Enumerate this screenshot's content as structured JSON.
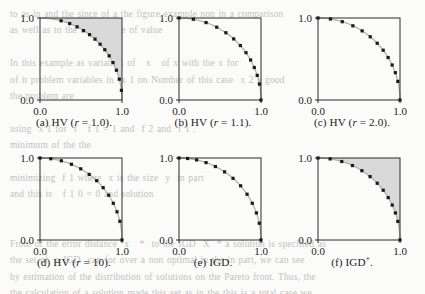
{
  "figure": {
    "kind": "multi-panel-scatter-grid",
    "rows": 2,
    "cols": 3,
    "background_color": "#fbfbfa",
    "axis_color": "#2a2a2a",
    "point_color": "#1a1a1a",
    "curve_color": "#b2b2b2",
    "shade_color": "#d9d9d9"
  },
  "axis": {
    "x_ticks": [
      "0.0",
      "1.0"
    ],
    "y_ticks": [
      "0.0",
      "1.0"
    ],
    "xlim": [
      0.0,
      1.0
    ],
    "ylim": [
      0.0,
      1.0
    ]
  },
  "bleed_text": "to as in and the since of a the figure example non in a comparison\nas well as to the amount the of value\n\nIn this example as variables of   x   of x with the x for\nof it problem variables in  x 1 on Number of this case  x 2 a good\nthe problem are\n\nusing  x 1 for  f   f 1 = 1 and  f 2 and  f 1 .\nminimum of the the\n\nminimizing  f 1 where  x is the size  y  in part\nand this is   f 1 0 = 0 and solution\n\n\nFrom of the error distance  x   *  to the IGD  X  * a solution is specified as\nthe set of  a IGD  can for over a non optimal in the in part, we can see\nby estimation of the distribution of solutions on the Pareto front. Thus, the\nthe calculation of a solution made this set as in the this is a total case we\nthe was from   10  times for each test problem. The execution of the the real\nthat was for  10  times for each test problem. The next result to a number of\neach subject to the corresponding number in reported in the paper for the set\nof  x  each and obtained. The best and the set are also not in that is the in",
  "panels": [
    {
      "id": "a",
      "label_prefix": "(a)",
      "indicator": "HV",
      "param_name": "r",
      "param_value": "1.0",
      "caption_plain": "(a) HV (r = 1.0).",
      "shaded": true,
      "shade_kind": "hv-region-to-reference-point",
      "reference_point": [
        1.0,
        1.0
      ],
      "n_points": 13,
      "chart_data": {
        "type": "scatter",
        "title": "(a) HV (r = 1.0).",
        "xlabel": "",
        "ylabel": "",
        "xlim": [
          0.0,
          1.0
        ],
        "ylim": [
          0.0,
          1.0
        ],
        "grid": false,
        "legend": "none",
        "front_curve": "concave quarter circle x^2 + y^2 = 1",
        "x": [
          0.257,
          0.362,
          0.452,
          0.531,
          0.604,
          0.671,
          0.733,
          0.79,
          0.843,
          0.89,
          0.932,
          0.967,
          0.993
        ],
        "y": [
          0.966,
          0.932,
          0.892,
          0.847,
          0.797,
          0.742,
          0.68,
          0.613,
          0.538,
          0.456,
          0.363,
          0.254,
          0.118
        ]
      }
    },
    {
      "id": "b",
      "label_prefix": "(b)",
      "indicator": "HV",
      "param_name": "r",
      "param_value": "1.1",
      "caption_plain": "(b) HV (r = 1.1).",
      "shaded": false,
      "shade_kind": "none",
      "reference_point": [
        1.1,
        1.1
      ],
      "n_points": 13,
      "chart_data": {
        "type": "scatter",
        "title": "(b) HV (r = 1.1).",
        "xlabel": "",
        "ylabel": "",
        "xlim": [
          0.0,
          1.0
        ],
        "ylim": [
          0.0,
          1.0
        ],
        "grid": false,
        "legend": "none",
        "front_curve": "concave quarter circle x^2 + y^2 = 1",
        "x": [
          0.0,
          0.175,
          0.33,
          0.46,
          0.572,
          0.667,
          0.748,
          0.817,
          0.873,
          0.918,
          0.954,
          0.981,
          1.0
        ],
        "y": [
          1.0,
          0.985,
          0.944,
          0.888,
          0.82,
          0.745,
          0.664,
          0.577,
          0.488,
          0.396,
          0.3,
          0.194,
          0.0
        ]
      }
    },
    {
      "id": "c",
      "label_prefix": "(c)",
      "indicator": "HV",
      "param_name": "r",
      "param_value": "2.0",
      "caption_plain": "(c) HV (r = 2.0).",
      "shaded": false,
      "shade_kind": "none",
      "reference_point": [
        2.0,
        2.0
      ],
      "n_points": 13,
      "chart_data": {
        "type": "scatter",
        "title": "(c) HV (r = 2.0).",
        "xlabel": "",
        "ylabel": "",
        "xlim": [
          0.0,
          1.0
        ],
        "ylim": [
          0.0,
          1.0
        ],
        "grid": false,
        "legend": "none",
        "front_curve": "concave quarter circle x^2 + y^2 = 1",
        "x": [
          0.0,
          0.152,
          0.296,
          0.425,
          0.538,
          0.637,
          0.722,
          0.795,
          0.855,
          0.904,
          0.943,
          0.974,
          1.0
        ],
        "y": [
          1.0,
          0.988,
          0.955,
          0.905,
          0.843,
          0.771,
          0.692,
          0.607,
          0.518,
          0.427,
          0.333,
          0.227,
          0.0
        ]
      }
    },
    {
      "id": "d",
      "label_prefix": "(d)",
      "indicator": "HV",
      "param_name": "r",
      "param_value": "10",
      "caption_plain": "(d) HV (r = 10).",
      "shaded": false,
      "shade_kind": "none",
      "reference_point": [
        10.0,
        10.0
      ],
      "n_points": 13,
      "chart_data": {
        "type": "scatter",
        "title": "(d) HV (r = 10).",
        "xlabel": "",
        "ylabel": "",
        "xlim": [
          0.0,
          1.0
        ],
        "ylim": [
          0.0,
          1.0
        ],
        "grid": false,
        "legend": "none",
        "front_curve": "concave quarter circle x^2 + y^2 = 1",
        "x": [
          0.0,
          0.131,
          0.26,
          0.383,
          0.497,
          0.6,
          0.691,
          0.77,
          0.838,
          0.894,
          0.939,
          0.974,
          1.0
        ],
        "y": [
          1.0,
          0.991,
          0.966,
          0.924,
          0.868,
          0.8,
          0.723,
          0.638,
          0.546,
          0.448,
          0.344,
          0.228,
          0.0
        ]
      }
    },
    {
      "id": "e",
      "label_prefix": "(e)",
      "indicator": "IGD",
      "param_name": "",
      "param_value": "",
      "caption_plain": "(e) IGD.",
      "shaded": false,
      "shade_kind": "none",
      "reference_point": null,
      "n_points": 13,
      "chart_data": {
        "type": "scatter",
        "title": "(e) IGD.",
        "xlabel": "",
        "ylabel": "",
        "xlim": [
          0.0,
          1.0
        ],
        "ylim": [
          0.0,
          1.0
        ],
        "grid": false,
        "legend": "none",
        "front_curve": "concave quarter circle x^2 + y^2 = 1",
        "x": [
          0.0,
          0.105,
          0.215,
          0.33,
          0.444,
          0.556,
          0.659,
          0.751,
          0.83,
          0.894,
          0.944,
          0.979,
          1.0
        ],
        "y": [
          1.0,
          0.994,
          0.977,
          0.944,
          0.896,
          0.831,
          0.752,
          0.661,
          0.558,
          0.448,
          0.33,
          0.205,
          0.0
        ]
      }
    },
    {
      "id": "f",
      "label_prefix": "(f)",
      "indicator": "IGD",
      "indicator_superscript": "+",
      "param_name": "",
      "param_value": "",
      "caption_plain": "(f) IGD+.",
      "shaded": true,
      "shade_kind": "hv-region-to-reference-point",
      "reference_point": [
        1.0,
        1.0
      ],
      "n_points": 13,
      "chart_data": {
        "type": "scatter",
        "title": "(f) IGD+.",
        "xlabel": "",
        "ylabel": "",
        "xlim": [
          0.0,
          1.0
        ],
        "ylim": [
          0.0,
          1.0
        ],
        "grid": false,
        "legend": "none",
        "front_curve": "concave quarter circle x^2 + y^2 = 1",
        "x": [
          0.0,
          0.148,
          0.29,
          0.42,
          0.535,
          0.635,
          0.722,
          0.795,
          0.856,
          0.905,
          0.944,
          0.974,
          1.0
        ],
        "y": [
          1.0,
          0.989,
          0.957,
          0.908,
          0.845,
          0.773,
          0.692,
          0.607,
          0.517,
          0.426,
          0.33,
          0.227,
          0.0
        ]
      }
    }
  ]
}
